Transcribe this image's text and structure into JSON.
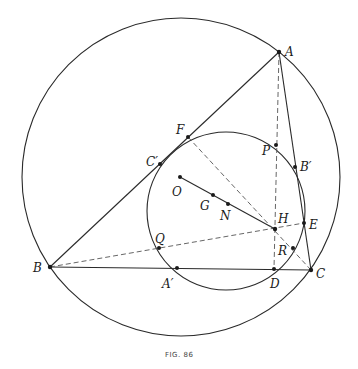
{
  "figure": {
    "caption": "FIG. 86",
    "points": {
      "A": {
        "label": "A"
      },
      "B": {
        "label": "B"
      },
      "C": {
        "label": "C"
      },
      "O": {
        "label": "O"
      },
      "G": {
        "label": "G"
      },
      "N": {
        "label": "N"
      },
      "H": {
        "label": "H"
      },
      "F": {
        "label": "F"
      },
      "C1": {
        "label": "C′"
      },
      "P": {
        "label": "P"
      },
      "B1": {
        "label": "B′"
      },
      "E": {
        "label": "E"
      },
      "R": {
        "label": "R"
      },
      "Q": {
        "label": "Q"
      },
      "A1": {
        "label": "A′"
      },
      "D": {
        "label": "D"
      }
    },
    "circles": [
      "circumcircle",
      "nine-point-circle"
    ],
    "segments_solid": [
      "AB",
      "BC",
      "CA",
      "OH"
    ],
    "segments_dashed": [
      "AD",
      "BE",
      "CF"
    ]
  }
}
